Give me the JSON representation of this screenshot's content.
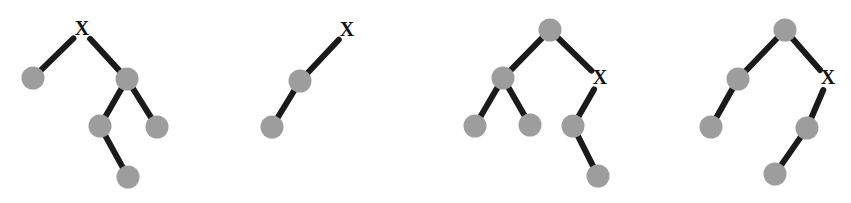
{
  "figure": {
    "background_color": "#ffffff",
    "node_color": "#9d9d9d",
    "edge_color": "#1a1a1a",
    "label_color": "#111111",
    "node_radius": 11.5,
    "edge_width": 6,
    "edge_gap": 9,
    "label_text": "X",
    "label_font_size": 20,
    "canvas": {
      "width": 851,
      "height": 203
    }
  },
  "trees": [
    {
      "name": "tree-1",
      "nodes": [
        {
          "id": "t1n0",
          "name": "tree-1-node-root-x",
          "x": 82,
          "y": 30,
          "type": "label",
          "label": "X"
        },
        {
          "id": "t1n1",
          "name": "tree-1-node-left-leaf",
          "x": 33,
          "y": 78,
          "type": "circle",
          "label": ""
        },
        {
          "id": "t1n2",
          "name": "tree-1-node-right",
          "x": 127,
          "y": 79,
          "type": "circle",
          "label": ""
        },
        {
          "id": "t1n3",
          "name": "tree-1-node-mid-left",
          "x": 100,
          "y": 126,
          "type": "circle",
          "label": ""
        },
        {
          "id": "t1n4",
          "name": "tree-1-node-mid-right",
          "x": 157,
          "y": 127,
          "type": "circle",
          "label": ""
        },
        {
          "id": "t1n5",
          "name": "tree-1-node-bottom",
          "x": 128,
          "y": 177,
          "type": "circle",
          "label": ""
        }
      ],
      "edges": [
        {
          "name": "tree-1-edge-root-left",
          "from": "t1n0",
          "to": "t1n1"
        },
        {
          "name": "tree-1-edge-root-right",
          "from": "t1n0",
          "to": "t1n2"
        },
        {
          "name": "tree-1-edge-right-midleft",
          "from": "t1n2",
          "to": "t1n3"
        },
        {
          "name": "tree-1-edge-right-midright",
          "from": "t1n2",
          "to": "t1n4"
        },
        {
          "name": "tree-1-edge-midleft-bottom",
          "from": "t1n3",
          "to": "t1n5"
        }
      ]
    },
    {
      "name": "tree-2",
      "nodes": [
        {
          "id": "t2n0",
          "name": "tree-2-node-root-x",
          "x": 347,
          "y": 31,
          "type": "label",
          "label": "X"
        },
        {
          "id": "t2n1",
          "name": "tree-2-node-middle",
          "x": 300,
          "y": 81,
          "type": "circle",
          "label": ""
        },
        {
          "id": "t2n2",
          "name": "tree-2-node-bottom",
          "x": 272,
          "y": 127,
          "type": "circle",
          "label": ""
        }
      ],
      "edges": [
        {
          "name": "tree-2-edge-root-middle",
          "from": "t2n0",
          "to": "t2n1"
        },
        {
          "name": "tree-2-edge-middle-bottom",
          "from": "t2n1",
          "to": "t2n2"
        }
      ]
    },
    {
      "name": "tree-3",
      "nodes": [
        {
          "id": "t3n0",
          "name": "tree-3-node-root",
          "x": 550,
          "y": 30,
          "type": "circle",
          "label": ""
        },
        {
          "id": "t3n1",
          "name": "tree-3-node-left",
          "x": 503,
          "y": 78,
          "type": "circle",
          "label": ""
        },
        {
          "id": "t3n2",
          "name": "tree-3-node-right-x",
          "x": 600,
          "y": 79,
          "type": "label",
          "label": "X"
        },
        {
          "id": "t3n3",
          "name": "tree-3-node-left-leaf-a",
          "x": 475,
          "y": 126,
          "type": "circle",
          "label": ""
        },
        {
          "id": "t3n4",
          "name": "tree-3-node-left-leaf-b",
          "x": 530,
          "y": 125,
          "type": "circle",
          "label": ""
        },
        {
          "id": "t3n5",
          "name": "tree-3-node-x-child",
          "x": 573,
          "y": 126,
          "type": "circle",
          "label": ""
        },
        {
          "id": "t3n6",
          "name": "tree-3-node-bottom",
          "x": 598,
          "y": 176,
          "type": "circle",
          "label": ""
        }
      ],
      "edges": [
        {
          "name": "tree-3-edge-root-left",
          "from": "t3n0",
          "to": "t3n1"
        },
        {
          "name": "tree-3-edge-root-x",
          "from": "t3n0",
          "to": "t3n2"
        },
        {
          "name": "tree-3-edge-left-leafa",
          "from": "t3n1",
          "to": "t3n3"
        },
        {
          "name": "tree-3-edge-left-leafb",
          "from": "t3n1",
          "to": "t3n4"
        },
        {
          "name": "tree-3-edge-x-child",
          "from": "t3n2",
          "to": "t3n5"
        },
        {
          "name": "tree-3-edge-child-bottom",
          "from": "t3n5",
          "to": "t3n6"
        }
      ]
    },
    {
      "name": "tree-4",
      "nodes": [
        {
          "id": "t4n0",
          "name": "tree-4-node-root",
          "x": 785,
          "y": 30,
          "type": "circle",
          "label": ""
        },
        {
          "id": "t4n1",
          "name": "tree-4-node-left",
          "x": 738,
          "y": 79,
          "type": "circle",
          "label": ""
        },
        {
          "id": "t4n2",
          "name": "tree-4-node-right-x",
          "x": 828,
          "y": 79,
          "type": "label",
          "label": "X"
        },
        {
          "id": "t4n3",
          "name": "tree-4-node-left-leaf",
          "x": 711,
          "y": 127,
          "type": "circle",
          "label": ""
        },
        {
          "id": "t4n4",
          "name": "tree-4-node-x-child",
          "x": 807,
          "y": 128,
          "type": "circle",
          "label": ""
        },
        {
          "id": "t4n5",
          "name": "tree-4-node-bottom",
          "x": 775,
          "y": 174,
          "type": "circle",
          "label": ""
        }
      ],
      "edges": [
        {
          "name": "tree-4-edge-root-left",
          "from": "t4n0",
          "to": "t4n1"
        },
        {
          "name": "tree-4-edge-root-x",
          "from": "t4n0",
          "to": "t4n2"
        },
        {
          "name": "tree-4-edge-left-leaf",
          "from": "t4n1",
          "to": "t4n3"
        },
        {
          "name": "tree-4-edge-x-child",
          "from": "t4n2",
          "to": "t4n4"
        },
        {
          "name": "tree-4-edge-child-bottom",
          "from": "t4n4",
          "to": "t4n5"
        }
      ]
    }
  ]
}
